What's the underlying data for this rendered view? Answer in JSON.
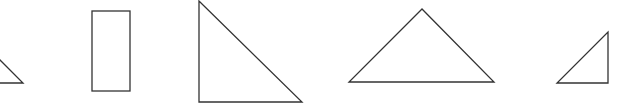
{
  "diagram": {
    "background": "#ffffff",
    "stroke_color": "#333333",
    "shapes": [
      {
        "id": "shape-1",
        "type": "triangle",
        "points": "-20,60 0,60 23,83 -20,83",
        "draw": "0,60 23,83 0,83"
      },
      {
        "id": "shape-2",
        "type": "rectangle",
        "x": 92,
        "y": 11,
        "width": 38,
        "height": 80
      },
      {
        "id": "shape-3",
        "type": "right-triangle",
        "points": "199,1 199,102 302,102"
      },
      {
        "id": "shape-4",
        "type": "triangle",
        "points": "422,9 349,82 494,82"
      },
      {
        "id": "shape-5",
        "type": "right-triangle",
        "points": "557,83 608,83 608,32"
      }
    ]
  }
}
